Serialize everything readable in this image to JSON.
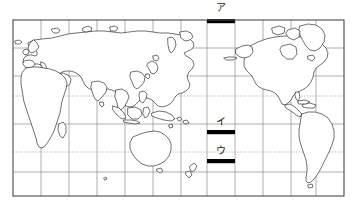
{
  "figure": {
    "kind": "world-map-outline",
    "projection_note": "Pacific-centered cylindrical world map with graticule",
    "background_color": "#ffffff",
    "land_fill": "#ffffff",
    "coastline_color": "#1a1a1a",
    "graticule_color": "#8a8a8a",
    "tropic_line_color": "#9a9a9a",
    "frame_color": "#4a4a4a",
    "marker_color": "#000000"
  },
  "frame": {
    "left": 13,
    "top": 20,
    "right": 344,
    "bottom": 196
  },
  "graticule": {
    "vertical_lines_x": [
      13,
      41,
      69,
      97,
      125,
      153,
      181,
      207,
      235,
      263,
      291,
      316,
      344
    ],
    "horizontal_lines_y": [
      20,
      48,
      76,
      96,
      124,
      152,
      172,
      196
    ],
    "dotted_lines_y": [
      96,
      152
    ],
    "dotted_labels": [
      "tropic-of-cancer",
      "tropic-of-capricorn"
    ]
  },
  "markers": [
    {
      "id": "marker-a",
      "label": "ア",
      "label_x": 216,
      "label_y": 4,
      "bar_x": 207,
      "bar_y": 20,
      "bar_w": 28,
      "bar_h": 4
    },
    {
      "id": "marker-i",
      "label": "イ",
      "label_x": 216,
      "label_y": 118,
      "bar_x": 207,
      "bar_y": 131,
      "bar_w": 28,
      "bar_h": 4
    },
    {
      "id": "marker-u",
      "label": "ウ",
      "label_x": 216,
      "label_y": 147,
      "bar_x": 207,
      "bar_y": 160,
      "bar_w": 28,
      "bar_h": 4
    }
  ],
  "regions": {
    "eurasia": "eurasia-landmass",
    "africa": "africa-landmass",
    "australia": "australia-landmass",
    "north_america": "north-america-landmass",
    "south_america": "south-america-landmass",
    "greenland": "greenland-landmass",
    "japan": "japan-islands",
    "new_zealand": "new-zealand-islands",
    "indonesia": "indonesia-archipelago",
    "philippines": "philippines-archipelago",
    "british_isles": "british-isles",
    "madagascar": "madagascar-island",
    "iceland": "iceland-island",
    "sri_lanka": "sri-lanka-island"
  }
}
